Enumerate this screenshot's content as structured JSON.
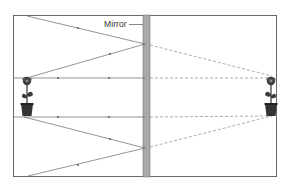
{
  "diagram": {
    "type": "plane-mirror-ray-diagram",
    "mirror_label": "Mirror",
    "colors": {
      "frame": "#6a6a6a",
      "mirror_fill": "#a9a9a9",
      "mirror_edge": "#777777",
      "ray": "#666666",
      "virtual_ray": "#8a8a8a",
      "flower": "#3a3a3a"
    },
    "objects": [
      {
        "name": "real-flower",
        "side": "left"
      },
      {
        "name": "virtual-flower-image",
        "side": "right"
      }
    ],
    "rays": [
      {
        "name": "incident-top",
        "kind": "real"
      },
      {
        "name": "reflected-top",
        "kind": "real"
      },
      {
        "name": "horizontal-top",
        "kind": "real"
      },
      {
        "name": "horizontal-bottom",
        "kind": "real"
      },
      {
        "name": "incident-bottom",
        "kind": "real"
      },
      {
        "name": "reflected-bottom",
        "kind": "real"
      },
      {
        "name": "virtual-top",
        "kind": "virtual"
      },
      {
        "name": "virtual-horizontal-top",
        "kind": "virtual"
      },
      {
        "name": "virtual-horizontal-bottom",
        "kind": "virtual"
      },
      {
        "name": "virtual-bottom",
        "kind": "virtual"
      }
    ]
  }
}
